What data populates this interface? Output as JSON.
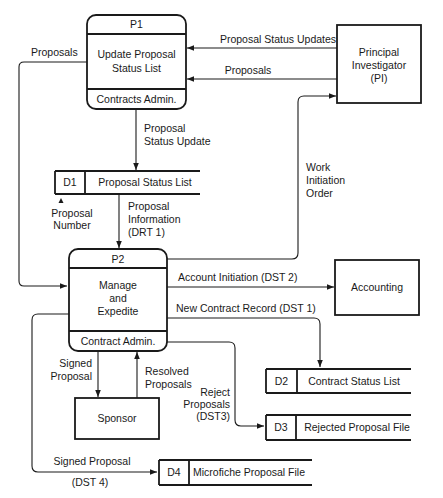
{
  "diagram": {
    "type": "data-flow-diagram",
    "processes": [
      {
        "id": "P1",
        "name_line1": "Update Proposal",
        "name_line2": "Status List",
        "owner": "Contracts Admin."
      },
      {
        "id": "P2",
        "name_line1": "Manage",
        "name_line2": "and",
        "name_line3": "Expedite",
        "owner": "Contract Admin."
      }
    ],
    "entities": [
      {
        "name_line1": "Principal",
        "name_line2": "Investigator",
        "name_line3": "(PI)"
      },
      {
        "name": "Accounting"
      },
      {
        "name": "Sponsor"
      }
    ],
    "stores": [
      {
        "id": "D1",
        "name": "Proposal Status List"
      },
      {
        "id": "D2",
        "name": "Contract Status List"
      },
      {
        "id": "D3",
        "name": "Rejected Proposal File"
      },
      {
        "id": "D4",
        "name": "Microfiche Proposal File"
      }
    ],
    "flows": {
      "proposals_left": "Proposals",
      "status_updates": "Proposal Status Updates",
      "proposals_pi": "Proposals",
      "status_update_l1": "Proposal",
      "status_update_l2": "Status Update",
      "work_l1": "Work",
      "work_l2": "Initiation",
      "work_l3": "Order",
      "proposal_number_l1": "Proposal",
      "proposal_number_l2": "Number",
      "proposal_info_l1": "Proposal",
      "proposal_info_l2": "Information",
      "proposal_info_l3": "(DRT 1)",
      "account_initiation": "Account Initiation (DST 2)",
      "new_contract": "New Contract Record (DST 1)",
      "signed_l1": "Signed",
      "signed_l2": "Proposal",
      "resolved_l1": "Resolved",
      "resolved_l2": "Proposals",
      "reject_l1": "Reject",
      "reject_l2": "Proposals",
      "reject_l3": "(DST3)",
      "signed_d4_l1": "Signed Proposal",
      "signed_d4_l2": "(DST 4)"
    }
  }
}
